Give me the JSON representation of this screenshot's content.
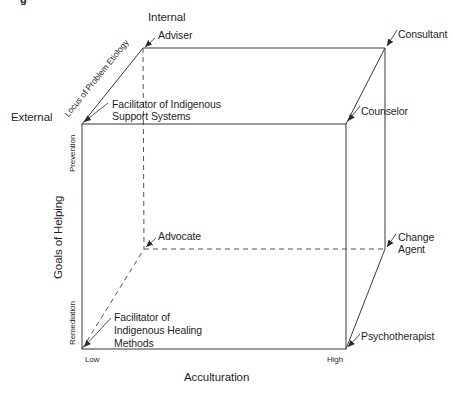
{
  "caption_fragment": "g",
  "axes": {
    "locus": {
      "title": "Locus of Problem Etiology",
      "internal_label": "Internal",
      "external_label": "External"
    },
    "goals": {
      "title": "Goals of Helping",
      "prevention_label": "Prevention",
      "remediation_label": "Remediation"
    },
    "acculturation": {
      "title": "Acculturation",
      "low_label": "Low",
      "high_label": "High"
    }
  },
  "roles": {
    "adviser": "Adviser",
    "consultant": "Consultant",
    "facilitator_support": "Facilitator of Indigenous\nSupport Systems",
    "counselor": "Counselor",
    "advocate": "Advocate",
    "change_agent": "Change\nAgent",
    "facilitator_healing": "Facilitator of\nIndigenous Healing\nMethods",
    "psychotherapist": "Psychotherapist"
  },
  "cube": {
    "front": {
      "tl": [
        82,
        124
      ],
      "tr": [
        346,
        124
      ],
      "bl": [
        82,
        349
      ],
      "br": [
        346,
        349
      ]
    },
    "back": {
      "tl": [
        143,
        48
      ],
      "tr": [
        385,
        48
      ],
      "bl": [
        144,
        249
      ],
      "br": [
        385,
        249
      ]
    },
    "line_color": "#3a3a3a",
    "dash_color": "#555555"
  }
}
